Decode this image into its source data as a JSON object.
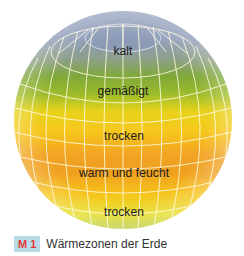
{
  "figure": {
    "zones": [
      {
        "label": "kalt",
        "color": "#8e9cb8"
      },
      {
        "label": "gemäßigt",
        "color": "#7fa83a"
      },
      {
        "label": "trocken",
        "color": "#f2c21a"
      },
      {
        "label": "warm und feucht",
        "color": "#f0a020"
      },
      {
        "label": "trocken",
        "color": "#f3d21e"
      }
    ],
    "grid_color": "#fffbe0"
  },
  "caption": {
    "badge": "M 1",
    "text": "Wärmezonen der Erde",
    "badge_bg": "#b9dbe8",
    "badge_color": "#e03a3a"
  }
}
